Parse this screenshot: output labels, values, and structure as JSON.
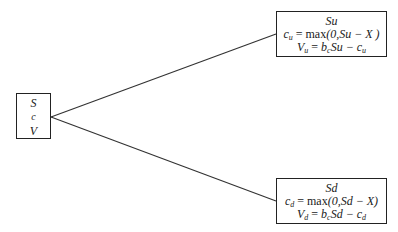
{
  "root": {
    "lines": [
      "S",
      "c",
      "V"
    ]
  },
  "up": {
    "title": "Su",
    "c_lhs": "c",
    "c_sub": "u",
    "c_eq": " = ",
    "c_func": "max",
    "c_args": "(0,Su − X )",
    "v_lhs": "V",
    "v_sub": "u",
    "v_eq": " = ",
    "v_b": "b",
    "v_bsub": "c",
    "v_mid": "Su − c",
    "v_tsub": "u"
  },
  "down": {
    "title": "Sd",
    "c_lhs": "c",
    "c_sub": "d",
    "c_eq": " = ",
    "c_func": "max",
    "c_args": "(0,Sd − X)",
    "v_lhs": "V",
    "v_sub": "d",
    "v_eq": " = ",
    "v_b": "b",
    "v_bsub": "c",
    "v_mid": "Sd − c",
    "v_tsub": "d"
  },
  "edges": [
    {
      "from": "root",
      "to": "up"
    },
    {
      "from": "root",
      "to": "down"
    }
  ]
}
